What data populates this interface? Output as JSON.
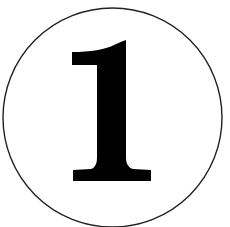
{
  "badge": {
    "number": "1",
    "circle_stroke_color": "#222222",
    "glyph_color": "#000000",
    "background_color": "#ffffff"
  }
}
